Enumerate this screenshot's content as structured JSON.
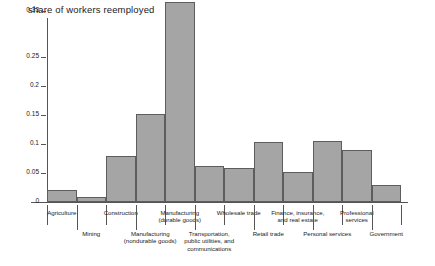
{
  "chart_data": {
    "type": "bar",
    "title": "share of workers reemployed",
    "xlabel": "",
    "ylabel": "",
    "ylim": [
      0,
      0.355
    ],
    "grid": false,
    "legend": "none",
    "ytick_labels": [
      "0",
      "0.05",
      "0.1",
      "0.15",
      "0.2",
      "0.25",
      "0.33"
    ],
    "ytick_values": [
      0,
      0.05,
      0.1,
      0.15,
      0.2,
      0.25,
      0.33
    ],
    "categories": [
      "Agriculture",
      "Mining",
      "Construction",
      "Manufacturing (nondurable goods)",
      "Manufacturing (durable goods)",
      "Transportation, public utilities, and communications",
      "Wholesale trade",
      "Retail trade",
      "Finance, insurance, and real estate",
      "Personal services",
      "Professional services",
      "Government"
    ],
    "values": [
      0.02,
      0.008,
      0.08,
      0.152,
      0.345,
      0.062,
      0.058,
      0.103,
      0.052,
      0.105,
      0.09,
      0.03
    ],
    "bar_color": "#a5a5a5",
    "bar_edge_color": "#5d5d5d",
    "axis_color": "#555555"
  },
  "labels": [
    {
      "line1": "Agriculture",
      "line2": "",
      "line3": "",
      "row": "top"
    },
    {
      "line1": "Mining",
      "line2": "",
      "line3": "",
      "row": "bottom"
    },
    {
      "line1": "Construction",
      "line2": "",
      "line3": "",
      "row": "top"
    },
    {
      "line1": "Manufacturing",
      "line2": "(nondurable goods)",
      "line3": "",
      "row": "bottom"
    },
    {
      "line1": "Manufacturing",
      "line2": "(durable goods)",
      "line3": "",
      "row": "top"
    },
    {
      "line1": "Transportation,",
      "line2": "public utilities, and",
      "line3": "communications",
      "row": "bottom"
    },
    {
      "line1": "Wholesale trade",
      "line2": "",
      "line3": "",
      "row": "top"
    },
    {
      "line1": "Retail trade",
      "line2": "",
      "line3": "",
      "row": "bottom"
    },
    {
      "line1": "Finance, insurance,",
      "line2": "and real estate",
      "line3": "",
      "row": "top"
    },
    {
      "line1": "Personal services",
      "line2": "",
      "line3": "",
      "row": "bottom"
    },
    {
      "line1": "Professional",
      "line2": "services",
      "line3": "",
      "row": "top"
    },
    {
      "line1": "Government",
      "line2": "",
      "line3": "",
      "row": "bottom"
    }
  ]
}
